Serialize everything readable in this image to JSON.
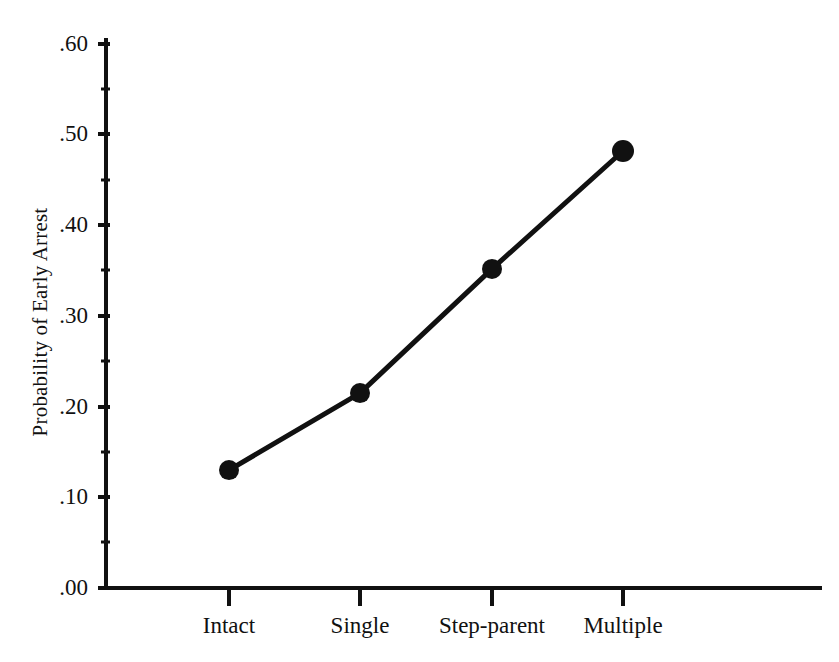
{
  "chart_data": {
    "type": "line",
    "title": "",
    "xlabel": "",
    "ylabel": "Probability of Early Arrest",
    "categories": [
      "Intact",
      "Single",
      "Step-parent",
      "Multiple"
    ],
    "values": [
      0.13,
      0.215,
      0.352,
      0.482
    ],
    "series": [
      {
        "name": "Probability of Early Arrest",
        "values": [
          0.13,
          0.215,
          0.352,
          0.482
        ]
      }
    ],
    "ylim": [
      0.0,
      0.6
    ],
    "ytick_labels": [
      ".00",
      ".10",
      ".20",
      ".30",
      ".40",
      ".50",
      ".60"
    ],
    "ytick_values": [
      0.0,
      0.1,
      0.2,
      0.3,
      0.4,
      0.5,
      0.6
    ],
    "yminor_tick_values": [
      0.05,
      0.15,
      0.25,
      0.35,
      0.45,
      0.55
    ],
    "grid": false,
    "legend": false,
    "legend_position": "none",
    "marker": "filled-circle",
    "line_color": "#111111",
    "marker_color": "#111111",
    "background_color": "#ffffff"
  },
  "axes": {
    "y_title": "Probability of Early Arrest",
    "y_ticks": [
      {
        "label": ".60",
        "value": 0.6
      },
      {
        "label": ".50",
        "value": 0.5
      },
      {
        "label": ".40",
        "value": 0.4
      },
      {
        "label": ".30",
        "value": 0.3
      },
      {
        "label": ".20",
        "value": 0.2
      },
      {
        "label": ".10",
        "value": 0.1
      },
      {
        "label": ".00",
        "value": 0.0
      }
    ],
    "x_ticks": [
      {
        "label": "Intact",
        "value": 0.13
      },
      {
        "label": "Single",
        "value": 0.215
      },
      {
        "label": "Step-parent",
        "value": 0.352
      },
      {
        "label": "Multiple",
        "value": 0.482
      }
    ]
  }
}
